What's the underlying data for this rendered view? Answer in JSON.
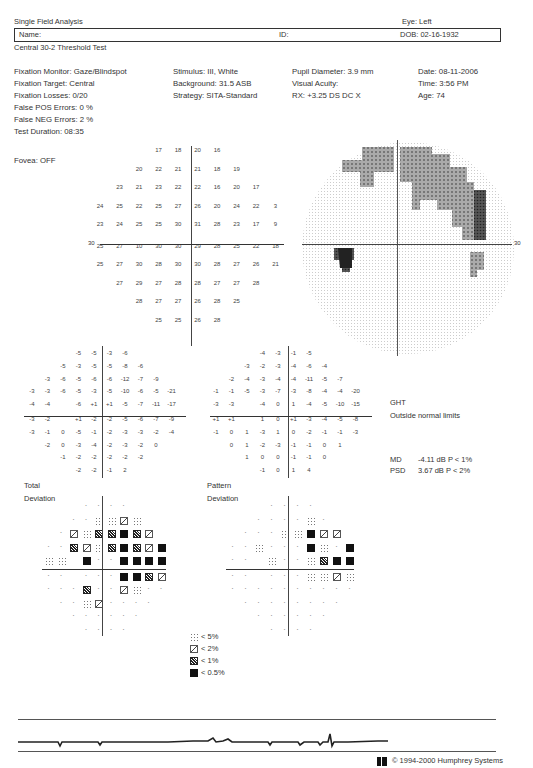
{
  "header": {
    "report_title": "Single Field Analysis",
    "eye": "Eye: Left",
    "name_label": "Name:",
    "id_label": "ID:",
    "dob": "DOB: 02-16-1932",
    "test_name": "Central 30-2 Threshold Test"
  },
  "info": {
    "col1": [
      "Fixation Monitor: Gaze/Blindspot",
      "Fixation Target: Central",
      "Fixation Losses: 0/20",
      "False POS Errors:  0 %",
      "False NEG Errors:  2 %",
      "Test Duration: 08:35"
    ],
    "col2": [
      "Stimulus: III, White",
      "Background: 31.5 ASB",
      "Strategy: SITA-Standard"
    ],
    "col3": [
      "Pupil Diameter: 3.9 mm",
      "Visual Acuity:",
      "RX: +3.25 DS      DC  X"
    ],
    "col4": [
      "Date: 08-11-2006",
      "Time:  3:56 PM",
      "Age: 74"
    ],
    "fovea": "Fovea: OFF"
  },
  "threshold": {
    "axis_label": "30",
    "rows": [
      [
        "",
        "",
        "",
        "17",
        "18",
        "20",
        "16",
        "",
        "",
        ""
      ],
      [
        "",
        "",
        "20",
        "22",
        "21",
        "21",
        "18",
        "19",
        "",
        ""
      ],
      [
        "",
        "23",
        "21",
        "23",
        "22",
        "22",
        "16",
        "20",
        "17",
        ""
      ],
      [
        "24",
        "25",
        "22",
        "25",
        "27",
        "26",
        "20",
        "24",
        "22",
        "3"
      ],
      [
        "23",
        "24",
        "25",
        "25",
        "30",
        "31",
        "28",
        "23",
        "17",
        "9"
      ],
      [
        "25",
        "27",
        "10",
        "30",
        "30",
        "29",
        "28",
        "25",
        "22",
        "18"
      ],
      [
        "25",
        "27",
        "30",
        "28",
        "30",
        "30",
        "28",
        "27",
        "26",
        "21"
      ],
      [
        "",
        "27",
        "29",
        "27",
        "28",
        "28",
        "27",
        "27",
        "28",
        ""
      ],
      [
        "",
        "",
        "28",
        "27",
        "27",
        "26",
        "28",
        "25",
        "",
        ""
      ],
      [
        "",
        "",
        "",
        "25",
        "25",
        "26",
        "28",
        "",
        "",
        ""
      ]
    ]
  },
  "grayscale": {
    "axis_label": "30"
  },
  "total_deviation": {
    "label_line1": "Total",
    "label_line2": "Deviation",
    "rows": [
      [
        "",
        "",
        "",
        "-5",
        "-5",
        "-3",
        "-6",
        "",
        "",
        ""
      ],
      [
        "",
        "",
        "-5",
        "-3",
        "-5",
        "-5",
        "-8",
        "-6",
        "",
        ""
      ],
      [
        "",
        "-3",
        "-6",
        "-5",
        "-6",
        "-6",
        "-12",
        "-7",
        "-9",
        ""
      ],
      [
        "-3",
        "-3",
        "-6",
        "-5",
        "-3",
        "-5",
        "-10",
        "-6",
        "-5",
        "-21"
      ],
      [
        "-4",
        "-4",
        "",
        "-6",
        "+1",
        "+1",
        "-5",
        "-7",
        "-11",
        "-17"
      ],
      [
        "-3",
        "-2",
        "",
        "+1",
        "-2",
        "-2",
        "-5",
        "-6",
        "-7",
        "-9"
      ],
      [
        "-3",
        "-1",
        "0",
        "-5",
        "-1",
        "-2",
        "-3",
        "-3",
        "-2",
        "-4"
      ],
      [
        "",
        "-2",
        "0",
        "-3",
        "-4",
        "-2",
        "-3",
        "-2",
        "0",
        ""
      ],
      [
        "",
        "",
        "-1",
        "-2",
        "-2",
        "-2",
        "-2",
        "-2",
        "",
        ""
      ],
      [
        "",
        "",
        "",
        "-2",
        "-2",
        "-1",
        "2",
        "",
        "",
        ""
      ]
    ],
    "symbols": [
      [
        "",
        "",
        "",
        "0",
        "0",
        "0",
        "0",
        "",
        "",
        ""
      ],
      [
        "",
        "",
        "0",
        "0",
        "5",
        "5",
        "2",
        "5",
        "",
        ""
      ],
      [
        "",
        "0",
        "2",
        "5",
        "1",
        "1",
        "05",
        "1",
        "2",
        ""
      ],
      [
        "0",
        "0",
        "1",
        "2",
        "5",
        "1",
        "05",
        "1",
        "2",
        "05"
      ],
      [
        "5",
        "5",
        "",
        "05",
        "0",
        "0",
        "05",
        "05",
        "05",
        "05"
      ],
      [
        "0",
        "0",
        "",
        "0",
        "0",
        "0",
        "05",
        "05",
        "1",
        "2"
      ],
      [
        "0",
        "0",
        "0",
        "1",
        "0",
        "0",
        "2",
        "5",
        "0",
        "0"
      ],
      [
        "",
        "0",
        "0",
        "5",
        "2",
        "0",
        "0",
        "0",
        "0",
        ""
      ],
      [
        "",
        "",
        "0",
        "0",
        "0",
        "0",
        "0",
        "0",
        "",
        ""
      ],
      [
        "",
        "",
        "",
        "0",
        "0",
        "0",
        "0",
        "",
        "",
        ""
      ]
    ]
  },
  "pattern_deviation": {
    "label_line1": "Pattern",
    "label_line2": "Deviation",
    "rows": [
      [
        "",
        "",
        "",
        "-4",
        "-3",
        "-1",
        "-5",
        "",
        "",
        ""
      ],
      [
        "",
        "",
        "-3",
        "-2",
        "-3",
        "-4",
        "-6",
        "-4",
        "",
        ""
      ],
      [
        "",
        "-2",
        "-4",
        "-3",
        "-4",
        "-4",
        "-11",
        "-5",
        "-7",
        ""
      ],
      [
        "-1",
        "-1",
        "-5",
        "-3",
        "-7",
        "-3",
        "-8",
        "-4",
        "-4",
        "-20"
      ],
      [
        "-3",
        "-3",
        "",
        "-4",
        "0",
        "1",
        "-4",
        "-5",
        "-10",
        "-15"
      ],
      [
        "+1",
        "+1",
        "",
        "1",
        "0",
        "+1",
        "-3",
        "-4",
        "-5",
        "-8"
      ],
      [
        "-1",
        "0",
        "1",
        "-3",
        "1",
        "0",
        "-2",
        "-1",
        "-1",
        "-3"
      ],
      [
        "",
        "0",
        "1",
        "-2",
        "-3",
        "-1",
        "-1",
        "0",
        "1",
        ""
      ],
      [
        "",
        "",
        "1",
        "0",
        "0",
        "-1",
        "-1",
        "0",
        "",
        ""
      ],
      [
        "",
        "",
        "",
        "-1",
        "0",
        "1",
        "4",
        "",
        "",
        ""
      ]
    ],
    "symbols": [
      [
        "",
        "",
        "",
        "0",
        "0",
        "0",
        "0",
        "",
        "",
        ""
      ],
      [
        "",
        "",
        "0",
        "0",
        "0",
        "0",
        "5",
        "0",
        "",
        ""
      ],
      [
        "",
        "0",
        "0",
        "0",
        "5",
        "5",
        "05",
        "2",
        "2",
        ""
      ],
      [
        "0",
        "0",
        "5",
        "0",
        "0",
        "0",
        "05",
        "5",
        "0",
        "05"
      ],
      [
        "0",
        "0",
        "",
        "5",
        "0",
        "0",
        "5",
        "1",
        "05",
        "05"
      ],
      [
        "0",
        "0",
        "",
        "0",
        "0",
        "0",
        "5",
        "5",
        "2",
        "5"
      ],
      [
        "0",
        "0",
        "0",
        "0",
        "0",
        "0",
        "0",
        "0",
        "0",
        "0"
      ],
      [
        "",
        "0",
        "0",
        "0",
        "0",
        "0",
        "0",
        "0",
        "0",
        ""
      ],
      [
        "",
        "",
        "0",
        "0",
        "0",
        "0",
        "0",
        "0",
        "",
        ""
      ],
      [
        "",
        "",
        "",
        "0",
        "0",
        "0",
        "0",
        "",
        "",
        ""
      ]
    ]
  },
  "ght": {
    "title": "GHT",
    "result": "Outside normal limits"
  },
  "indices": {
    "md_label": "MD",
    "md_value": "-4.11 dB  P < 1%",
    "psd_label": "PSD",
    "psd_value": "3.67 dB  P < 2%"
  },
  "legend": [
    {
      "symbol": "5",
      "label": "< 5%"
    },
    {
      "symbol": "2",
      "label": "< 2%"
    },
    {
      "symbol": "1",
      "label": "< 1%"
    },
    {
      "symbol": "05",
      "label": "< 0.5%"
    }
  ],
  "footer": {
    "copyright": "© 1994-2000 Humphrey Systems"
  }
}
